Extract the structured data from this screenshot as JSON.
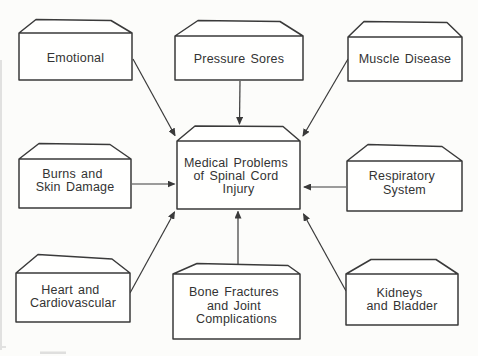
{
  "diagram": {
    "center_box": {
      "id": "medical-problems-of-spinal-cord-injury",
      "lines": [
        "Medical Problems",
        "of Spinal Cord",
        "Injury"
      ]
    },
    "boxes": [
      {
        "id": "emotional",
        "lines": [
          "Emotional"
        ]
      },
      {
        "id": "pressure-sores",
        "lines": [
          "Pressure Sores"
        ]
      },
      {
        "id": "muscle-disease",
        "lines": [
          "Muscle Disease"
        ]
      },
      {
        "id": "burns-and-skin-damage",
        "lines": [
          "Burns and",
          "Skin Damage"
        ]
      },
      {
        "id": "respiratory-system",
        "lines": [
          "Respiratory",
          "System"
        ]
      },
      {
        "id": "heart-and-cardiovascular",
        "lines": [
          "Heart and",
          "Cardiovascular"
        ]
      },
      {
        "id": "bone-fractures-and-joint-complications",
        "lines": [
          "Bone Fractures",
          "and Joint",
          "Complications"
        ]
      },
      {
        "id": "kidneys-and-bladder",
        "lines": [
          "Kidneys",
          "and Bladder"
        ]
      }
    ],
    "arrows": [
      {
        "from": "emotional",
        "to": "medical-problems-of-spinal-cord-injury"
      },
      {
        "from": "pressure-sores",
        "to": "medical-problems-of-spinal-cord-injury"
      },
      {
        "from": "muscle-disease",
        "to": "medical-problems-of-spinal-cord-injury"
      },
      {
        "from": "burns-and-skin-damage",
        "to": "medical-problems-of-spinal-cord-injury"
      },
      {
        "from": "respiratory-system",
        "to": "medical-problems-of-spinal-cord-injury"
      },
      {
        "from": "heart-and-cardiovascular",
        "to": "medical-problems-of-spinal-cord-injury"
      },
      {
        "from": "bone-fractures-and-joint-complications",
        "to": "medical-problems-of-spinal-cord-injury"
      },
      {
        "from": "kidneys-and-bladder",
        "to": "medical-problems-of-spinal-cord-injury"
      }
    ],
    "colors": {
      "line": "#3a3a3a",
      "text": "#333333",
      "box_fill": "#fffffe",
      "background": "#fcfcfa"
    }
  }
}
